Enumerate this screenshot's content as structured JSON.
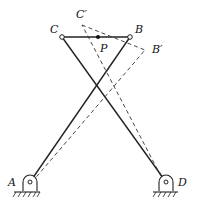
{
  "diagram": {
    "type": "four-bar linkage (crossed)",
    "points": {
      "A": {
        "label": "A",
        "x": 30,
        "y": 182
      },
      "D": {
        "label": "D",
        "x": 166,
        "y": 182
      },
      "C": {
        "label": "C",
        "x": 62,
        "y": 37
      },
      "B": {
        "label": "B",
        "x": 130,
        "y": 37
      },
      "P": {
        "label": "P",
        "x": 98,
        "y": 37
      },
      "C_prime": {
        "label": "C′",
        "x": 82,
        "y": 25
      },
      "B_prime": {
        "label": "B′",
        "x": 145,
        "y": 50
      }
    },
    "labels": {
      "A": "A",
      "D": "D",
      "C": "C",
      "B": "B",
      "P": "P",
      "C_prime": "C′",
      "B_prime": "B′"
    },
    "links_solid": [
      "A-B",
      "D-C",
      "C-B"
    ],
    "links_dashed": [
      "A-B′",
      "D-C′",
      "C′-B′"
    ],
    "colors": {
      "stroke": "#222222",
      "background": "#ffffff"
    }
  }
}
